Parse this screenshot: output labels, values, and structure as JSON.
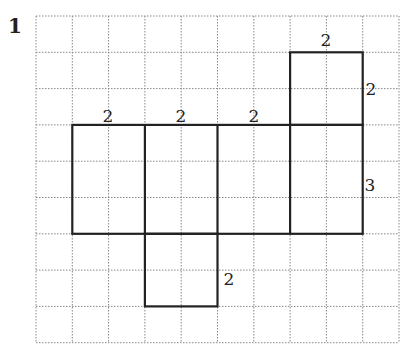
{
  "problem": {
    "number": "1"
  },
  "grid": {
    "origin_x": 36,
    "origin_y": 16,
    "cell": 36.3,
    "cols": 10,
    "rows": 9,
    "line_color": "#888888"
  },
  "shape": {
    "stroke_color": "#222222",
    "main_rect": {
      "col": 1,
      "row": 3,
      "w": 8,
      "h": 3
    },
    "dividers": [
      3,
      5,
      7
    ],
    "top_box": {
      "col": 7,
      "row": 1,
      "w": 2,
      "h": 2
    },
    "bottom_box": {
      "col": 3,
      "row": 6,
      "w": 2,
      "h": 2
    }
  },
  "labels": [
    {
      "text": "2",
      "x": 108,
      "y": 122,
      "name": "label-width-1"
    },
    {
      "text": "2",
      "x": 181,
      "y": 122,
      "name": "label-width-2"
    },
    {
      "text": "2",
      "x": 254,
      "y": 122,
      "name": "label-width-3"
    },
    {
      "text": "2",
      "x": 326,
      "y": 46,
      "name": "label-top-box-width"
    },
    {
      "text": "2",
      "x": 371,
      "y": 95,
      "name": "label-top-box-height"
    },
    {
      "text": "3",
      "x": 370,
      "y": 191,
      "name": "label-main-height"
    },
    {
      "text": "2",
      "x": 229,
      "y": 285,
      "name": "label-bottom-box-height"
    }
  ]
}
